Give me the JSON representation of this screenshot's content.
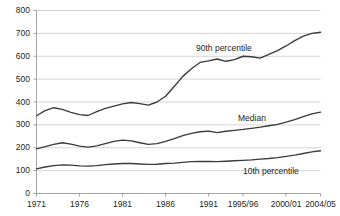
{
  "chart_data": {
    "type": "line",
    "title": "",
    "subtitle": "",
    "xlabel": "",
    "ylabel": "",
    "grid": true,
    "legend_position": "inline-annotations",
    "ylim": [
      0,
      800
    ],
    "yticks": [
      0,
      100,
      200,
      300,
      400,
      500,
      600,
      700,
      800
    ],
    "ytick_labels": [
      "0",
      "100",
      "200",
      "300",
      "400",
      "500",
      "600",
      "700",
      "800"
    ],
    "xtick_labels": [
      "1971",
      "1976",
      "1981",
      "1986",
      "1991",
      "1995/96",
      "2000/01",
      "2004/05"
    ],
    "xtick_values": [
      1971,
      1976,
      1981,
      1986,
      1991,
      1995,
      2000,
      2004
    ],
    "xlim": [
      1971,
      2004
    ],
    "x": [
      1971,
      1972,
      1973,
      1974,
      1975,
      1976,
      1977,
      1978,
      1979,
      1980,
      1981,
      1982,
      1983,
      1984,
      1985,
      1986,
      1987,
      1988,
      1989,
      1990,
      1991,
      1992,
      1993,
      1994,
      1995,
      1996,
      1997,
      1998,
      1999,
      2000,
      2001,
      2002,
      2003,
      2004
    ],
    "series": [
      {
        "name": "90th percentile",
        "color": "#3b3b3b",
        "label_x": 196,
        "label_y": 44,
        "values": [
          340,
          362,
          375,
          368,
          355,
          345,
          341,
          358,
          372,
          382,
          392,
          398,
          393,
          386,
          400,
          425,
          468,
          512,
          545,
          573,
          580,
          588,
          578,
          585,
          600,
          598,
          592,
          608,
          625,
          645,
          668,
          688,
          700,
          705
        ]
      },
      {
        "name": "Median",
        "color": "#3b3b3b",
        "label_x": 238,
        "label_y": 114,
        "values": [
          195,
          205,
          215,
          222,
          216,
          207,
          203,
          208,
          218,
          228,
          233,
          230,
          222,
          215,
          218,
          228,
          240,
          253,
          263,
          270,
          273,
          266,
          272,
          276,
          280,
          285,
          290,
          296,
          302,
          312,
          323,
          336,
          348,
          356
        ]
      },
      {
        "name": "10th percentile",
        "color": "#3b3b3b",
        "label_x": 243,
        "label_y": 167,
        "values": [
          108,
          116,
          122,
          125,
          124,
          121,
          120,
          122,
          126,
          129,
          131,
          131,
          129,
          127,
          128,
          131,
          133,
          136,
          139,
          140,
          140,
          139,
          141,
          143,
          145,
          147,
          150,
          153,
          157,
          162,
          168,
          175,
          182,
          187
        ]
      }
    ]
  },
  "style": {
    "grid_color": "#c9c9c9",
    "axis_color": "#9a9a9a",
    "text_color": "#231f20",
    "line_color": "#3b3b3b",
    "background": "#ffffff"
  }
}
